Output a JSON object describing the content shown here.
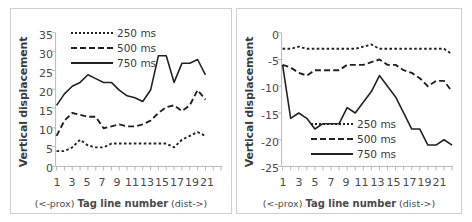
{
  "figure": {
    "panels": [
      {
        "id": "left",
        "y_axis_title": "Vertical displacement",
        "x_caption_prox": "(<-prox)",
        "x_caption_mid": "Tag line number",
        "x_caption_dist": "(dist->)",
        "y_ticks": [
          "0",
          "5",
          "10",
          "15",
          "20",
          "25",
          "30",
          "35"
        ],
        "x_ticks": [
          "1",
          "3",
          "5",
          "7",
          "9",
          "11",
          "13",
          "15",
          "17",
          "19",
          "21"
        ],
        "legend": [
          {
            "label": "250 ms",
            "style": "dotted"
          },
          {
            "label": "500 ms",
            "style": "dashed"
          },
          {
            "label": "750 ms",
            "style": "solid"
          }
        ]
      },
      {
        "id": "right",
        "y_axis_title": "Vertical displacement",
        "x_caption_prox": "(<-prox)",
        "x_caption_mid": "Tag line number",
        "x_caption_dist": "(dist->)",
        "y_ticks": [
          "-25",
          "-20",
          "-15",
          "-10",
          "-5",
          "0"
        ],
        "x_ticks": [
          "1",
          "3",
          "5",
          "7",
          "9",
          "11",
          "13",
          "15",
          "17",
          "19",
          "21"
        ],
        "legend": [
          {
            "label": "250 ms",
            "style": "dotted"
          },
          {
            "label": "500 ms",
            "style": "dashed"
          },
          {
            "label": "750 ms",
            "style": "solid"
          }
        ]
      }
    ]
  },
  "chart_data": [
    {
      "type": "line",
      "title": "",
      "xlabel": "Tag line number",
      "ylabel": "Vertical displacement",
      "xlim": [
        1,
        22
      ],
      "ylim": [
        0,
        35
      ],
      "ytick_step": 5,
      "grid": false,
      "legend_position": "top-center",
      "x": [
        1,
        2,
        3,
        4,
        5,
        6,
        7,
        8,
        9,
        10,
        11,
        12,
        13,
        14,
        15,
        16,
        17,
        18,
        19,
        20
      ],
      "series": [
        {
          "name": "250 ms",
          "style": "dotted",
          "color": "#222222",
          "values": [
            4,
            4,
            5,
            7,
            5.5,
            5,
            5,
            6,
            6,
            6,
            6,
            6,
            6,
            6,
            6,
            5,
            7,
            8,
            9,
            8
          ]
        },
        {
          "name": "500 ms",
          "style": "dashed",
          "color": "#222222",
          "values": [
            8,
            12,
            14,
            13.5,
            13,
            13,
            10,
            10.5,
            11,
            10.5,
            10.5,
            11,
            12,
            14,
            15.5,
            16,
            14.5,
            16,
            20,
            17.5
          ]
        },
        {
          "name": "750 ms",
          "style": "solid",
          "color": "#222222",
          "values": [
            16,
            19,
            21,
            22,
            24,
            23,
            22,
            22,
            20,
            18.5,
            18,
            17,
            20,
            29,
            29,
            22,
            27,
            27,
            28,
            24
          ]
        }
      ]
    },
    {
      "type": "line",
      "title": "",
      "xlabel": "Tag line number",
      "ylabel": "Vertical displacement",
      "xlim": [
        1,
        22
      ],
      "ylim": [
        -25,
        0
      ],
      "ytick_step": 5,
      "grid": false,
      "legend_position": "bottom-center",
      "x": [
        1,
        2,
        3,
        4,
        5,
        6,
        7,
        8,
        9,
        10,
        11,
        12,
        13,
        14,
        15,
        16,
        17,
        18,
        19,
        20,
        21,
        22
      ],
      "series": [
        {
          "name": "250 ms",
          "style": "dotted",
          "color": "#222222",
          "values": [
            -3,
            -3,
            -2.6,
            -3,
            -3,
            -3,
            -3,
            -3,
            -3,
            -3,
            -2.6,
            -2.2,
            -3,
            -3,
            -3,
            -3,
            -3,
            -3,
            -3,
            -3,
            -3,
            -4
          ]
        },
        {
          "name": "500 ms",
          "style": "dashed",
          "color": "#222222",
          "values": [
            -6,
            -6.5,
            -7.5,
            -8,
            -7,
            -7,
            -7,
            -7,
            -6,
            -6,
            -6,
            -5.5,
            -5,
            -6,
            -6,
            -7,
            -7.5,
            -8.5,
            -10,
            -9,
            -9,
            -11
          ]
        },
        {
          "name": "750 ms",
          "style": "solid",
          "color": "#222222",
          "values": [
            -6,
            -16,
            -15,
            -16,
            -18,
            -17,
            -17,
            -17,
            -14,
            -15,
            -13,
            -11,
            -8,
            -10,
            -12,
            -15,
            -18,
            -18,
            -21,
            -21,
            -20,
            -21
          ]
        }
      ]
    }
  ]
}
